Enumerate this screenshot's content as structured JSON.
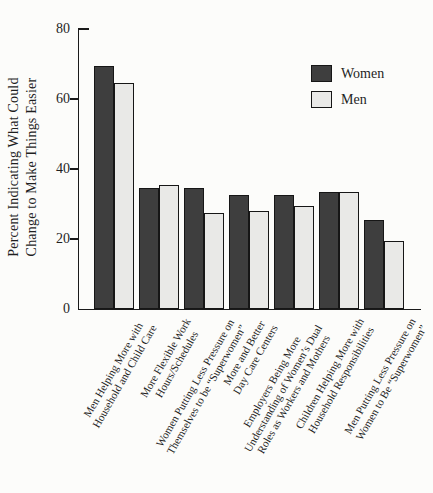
{
  "chart_data": {
    "type": "bar",
    "title": "",
    "xlabel": "",
    "ylabel": "Percent Indicating What Could\nChange to Make Things Easier",
    "ylim": [
      0,
      80
    ],
    "yticks": [
      80,
      60,
      40,
      20,
      0
    ],
    "grid": false,
    "legend_position": "upper-right",
    "axis_color": "#1a1a1a",
    "categories": [
      "Men Helping More with\nHousehold and Child Care",
      "More Flexible Work\nHours/Schedules",
      "Women Putting Less Pressure on\nThemselves to be “Superwomen”",
      "More and Better\nDay Care Centers",
      "Employers Being More\nUnderstanding of Women’s Dual\nRoles as Workers and Mothers",
      "Children Helping More with\nHousehold Responsibilities",
      "Men Putting Less Pressure on\nWomen to Be “Superwomen”"
    ],
    "series": [
      {
        "name": "Women",
        "color": "#3e3e3e",
        "values": [
          69.5,
          34.5,
          34.5,
          32.5,
          32.5,
          33.5,
          25.5
        ]
      },
      {
        "name": "Men",
        "color": "#e9e9e7",
        "values": [
          64.5,
          35.5,
          27.5,
          28,
          29.5,
          33.5,
          19.5
        ]
      }
    ]
  }
}
